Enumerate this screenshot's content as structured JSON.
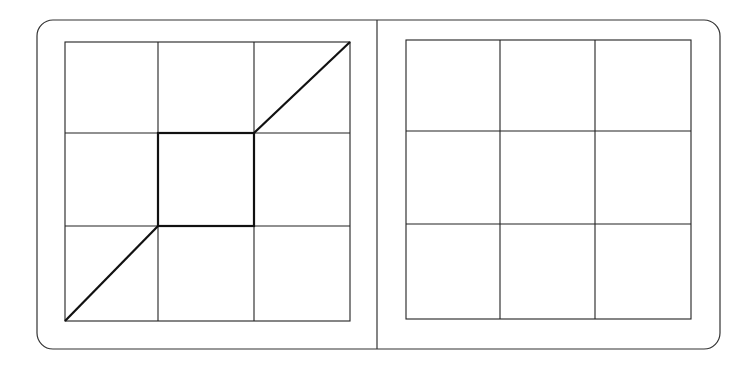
{
  "diagram": {
    "type": "grid-puzzle",
    "panels": [
      {
        "name": "left",
        "rows": 3,
        "cols": 3,
        "highlighted_cell": {
          "row": 1,
          "col": 1
        },
        "diagonal_lines": [
          {
            "from": "bottom-left-corner",
            "to": "center-cell-bottom-left"
          },
          {
            "from": "center-cell-top-right",
            "to": "top-right-corner"
          }
        ]
      },
      {
        "name": "right",
        "rows": 3,
        "cols": 3,
        "highlighted_cell": null,
        "diagonal_lines": []
      }
    ],
    "colors": {
      "stroke": "#222222",
      "background": "#ffffff"
    }
  }
}
